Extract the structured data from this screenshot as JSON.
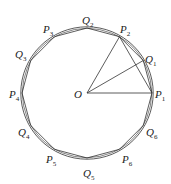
{
  "diagram": {
    "type": "geometry",
    "center": {
      "label": "O",
      "x": 87,
      "y": 93
    },
    "radius": 65,
    "colors": {
      "stroke": "#333333",
      "text": "#222222",
      "background": "#ffffff"
    },
    "points": [
      {
        "name": "P",
        "sub": "1",
        "angle": 0,
        "lx": 155,
        "ly": 98
      },
      {
        "name": "Q",
        "sub": "1",
        "angle": 30,
        "lx": 145,
        "ly": 63
      },
      {
        "name": "P",
        "sub": "2",
        "angle": 60,
        "lx": 120,
        "ly": 33
      },
      {
        "name": "Q",
        "sub": "2",
        "angle": 90,
        "lx": 82,
        "ly": 24
      },
      {
        "name": "P",
        "sub": "3",
        "angle": 120,
        "lx": 43,
        "ly": 33
      },
      {
        "name": "Q",
        "sub": "3",
        "angle": 150,
        "lx": 15,
        "ly": 58
      },
      {
        "name": "P",
        "sub": "4",
        "angle": 180,
        "lx": 9,
        "ly": 98
      },
      {
        "name": "Q",
        "sub": "4",
        "angle": 210,
        "lx": 18,
        "ly": 136
      },
      {
        "name": "P",
        "sub": "5",
        "angle": 240,
        "lx": 46,
        "ly": 163
      },
      {
        "name": "Q",
        "sub": "5",
        "angle": 270,
        "lx": 83,
        "ly": 177
      },
      {
        "name": "P",
        "sub": "6",
        "angle": 300,
        "lx": 122,
        "ly": 163
      },
      {
        "name": "Q",
        "sub": "6",
        "angle": 330,
        "lx": 146,
        "ly": 136
      }
    ],
    "segments": [
      [
        "O",
        "P1"
      ],
      [
        "O",
        "P2"
      ],
      [
        "O",
        "Q1"
      ],
      [
        "P2",
        "P1"
      ]
    ],
    "center_label_pos": {
      "x": 74,
      "y": 98
    }
  }
}
